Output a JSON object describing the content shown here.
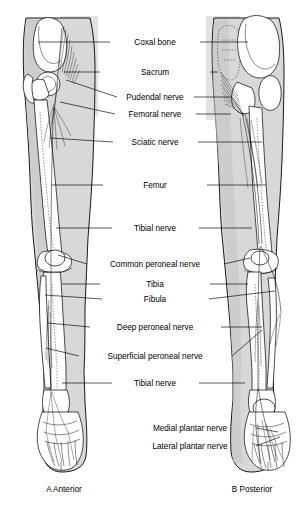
{
  "figure": {
    "background_color": "#ffffff",
    "ink_color": "#000000",
    "flesh_color": "#d8d8d8",
    "width": 305,
    "height": 515
  },
  "panels": [
    {
      "id": "A",
      "caption": "A Anterior",
      "cx": 64,
      "cy": 489
    },
    {
      "id": "B",
      "caption": "B Posterior",
      "cx": 252,
      "cy": 489
    }
  ],
  "labels": [
    {
      "key": "coxal_bone",
      "text": "Coxal bone",
      "cx": 155,
      "cy": 42,
      "left_line": [
        110,
        42,
        38,
        42
      ],
      "right_line": [
        200,
        42,
        248,
        42
      ]
    },
    {
      "key": "sacrum",
      "text": "Sacrum",
      "cx": 155,
      "cy": 72,
      "left_line": [
        100,
        72,
        64,
        72
      ],
      "right_line": [
        210,
        72,
        218,
        72
      ]
    },
    {
      "key": "pudendal_nerve",
      "text": "Pudendal nerve",
      "cx": 155,
      "cy": 97,
      "left_line": [
        117,
        97,
        66,
        80
      ],
      "right_line": [
        194,
        97,
        232,
        97
      ]
    },
    {
      "key": "femoral_nerve",
      "text": "Femoral nerve",
      "cx": 155,
      "cy": 114,
      "left_line": [
        115,
        114,
        60,
        102
      ],
      "right_line": [
        196,
        114,
        231,
        114
      ]
    },
    {
      "key": "sciatic_nerve",
      "text": "Sciatic nerve",
      "cx": 155,
      "cy": 142,
      "left_line": [
        113,
        142,
        50,
        138
      ],
      "right_line": [
        198,
        142,
        262,
        142
      ]
    },
    {
      "key": "femur",
      "text": "Femur",
      "cx": 155,
      "cy": 185,
      "left_line": [
        103,
        185,
        52,
        185
      ],
      "right_line": [
        207,
        185,
        266,
        185
      ]
    },
    {
      "key": "tibial_nerve_upper",
      "text": "Tibial nerve",
      "cx": 155,
      "cy": 228,
      "left_line": [
        112,
        228,
        56,
        228
      ],
      "right_line": [
        199,
        228,
        252,
        228
      ]
    },
    {
      "key": "common_peroneal_nerve",
      "text": "Common peroneal nerve",
      "cx": 155,
      "cy": 264,
      "left_line": [
        87,
        264,
        58,
        255
      ],
      "right_line": [
        224,
        264,
        250,
        258
      ]
    },
    {
      "key": "tibia",
      "text": "Tibia",
      "cx": 155,
      "cy": 284,
      "left_line": [
        100,
        284,
        62,
        284
      ],
      "right_line": [
        210,
        284,
        248,
        284
      ]
    },
    {
      "key": "fibula",
      "text": "Fibula",
      "cx": 155,
      "cy": 299,
      "left_line": [
        102,
        299,
        45,
        295
      ],
      "right_line": [
        209,
        299,
        275,
        291
      ]
    },
    {
      "key": "deep_peroneal_nerve",
      "text": "Deep peroneal nerve",
      "cx": 155,
      "cy": 327,
      "left_line": [
        90,
        327,
        48,
        323
      ],
      "right_line": [
        221,
        327,
        262,
        327
      ]
    },
    {
      "key": "superficial_peroneal_nerve",
      "text": "Superficial peroneal nerve",
      "cx": 155,
      "cy": 356,
      "left_line": [
        79,
        356,
        46,
        348
      ],
      "right_line": [
        232,
        356,
        262,
        330
      ]
    },
    {
      "key": "tibial_nerve_lower",
      "text": "Tibial nerve",
      "cx": 155,
      "cy": 383,
      "left_line": [
        112,
        383,
        62,
        383
      ],
      "right_line": [
        199,
        383,
        245,
        383
      ]
    },
    {
      "key": "medial_plantar_nerve",
      "text": "Medial plantar nerve",
      "cx": 190,
      "cy": 428,
      "left_line": null,
      "right_line": [
        256,
        428,
        278,
        432
      ]
    },
    {
      "key": "lateral_plantar_nerve",
      "text": "Lateral plantar nerve",
      "cx": 190,
      "cy": 446,
      "left_line": null,
      "right_line": [
        256,
        446,
        280,
        437
      ]
    }
  ],
  "structures": {
    "bones": [
      "Coxal bone",
      "Sacrum",
      "Femur",
      "Tibia",
      "Fibula",
      "Patella",
      "Tarsals",
      "Metatarsals",
      "Phalanges"
    ],
    "nerves": [
      "Pudendal nerve",
      "Femoral nerve",
      "Sciatic nerve",
      "Tibial nerve",
      "Common peroneal nerve",
      "Deep peroneal nerve",
      "Superficial peroneal nerve",
      "Medial plantar nerve",
      "Lateral plantar nerve"
    ]
  }
}
